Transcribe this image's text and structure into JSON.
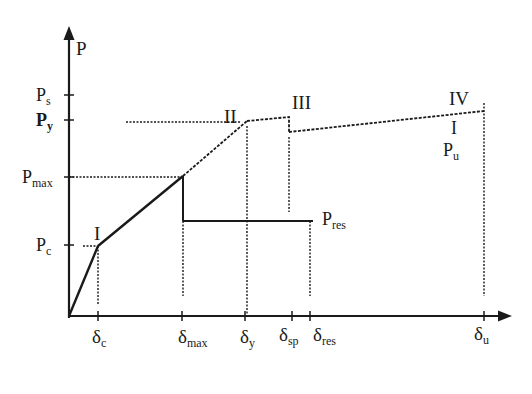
{
  "diagram": {
    "type": "load-deflection curve",
    "axes": {
      "y_label": "P",
      "x_labels": {
        "delta_c": {
          "base": "δ",
          "sub": "c"
        },
        "delta_max": {
          "base": "δ",
          "sub": "max"
        },
        "delta_y": {
          "base": "δ",
          "sub": "y"
        },
        "delta_sp": {
          "base": "δ",
          "sub": "sp"
        },
        "delta_res": {
          "base": "δ",
          "sub": "res"
        },
        "delta_u": {
          "base": "δ",
          "sub": "u"
        }
      },
      "y_labels": {
        "P_s": {
          "base": "P",
          "sub": "s"
        },
        "P_y": {
          "base": "P",
          "sub": "y"
        },
        "P_max": {
          "base": "P",
          "sub": "max"
        },
        "P_c": {
          "base": "P",
          "sub": "c"
        }
      }
    },
    "stage_labels": {
      "I": "I",
      "II": "II",
      "III": "III",
      "IV": "IV",
      "IV_marker": "I"
    },
    "annotations": {
      "P_res": {
        "base": "P",
        "sub": "res"
      },
      "P_u": {
        "base": "P",
        "sub": "u"
      }
    },
    "colors": {
      "line": "#1a1a1a",
      "background": "#ffffff"
    }
  }
}
